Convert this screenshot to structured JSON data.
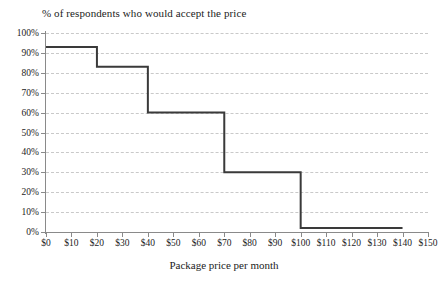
{
  "chart": {
    "title": "% of respondents who would accept the price",
    "xlabel": "Package price per month",
    "ylabel": ""
  },
  "chart_data": {
    "type": "line",
    "subtype": "step-post",
    "title": "% of respondents who would accept the price",
    "xlabel": "Package price per month",
    "ylabel": "",
    "xlim": [
      0,
      150
    ],
    "ylim": [
      0,
      100
    ],
    "grid": true,
    "legend": null,
    "x_tick_labels": [
      "$0",
      "$10",
      "$20",
      "$30",
      "$40",
      "$50",
      "$60",
      "$70",
      "$80",
      "$90",
      "$100",
      "$110",
      "$120",
      "$130",
      "$140",
      "$150"
    ],
    "x_tick_values": [
      0,
      10,
      20,
      30,
      40,
      50,
      60,
      70,
      80,
      90,
      100,
      110,
      120,
      130,
      140,
      150
    ],
    "y_tick_labels": [
      "0%",
      "10%",
      "20%",
      "30%",
      "40%",
      "50%",
      "60%",
      "70%",
      "80%",
      "90%",
      "100%"
    ],
    "y_tick_values": [
      0,
      10,
      20,
      30,
      40,
      50,
      60,
      70,
      80,
      90,
      100
    ],
    "series": [
      {
        "name": "% of respondents who would accept the price",
        "color": "#3a3a3a",
        "steps": [
          {
            "x_start": 0,
            "x_end": 20,
            "value": 93
          },
          {
            "x_start": 20,
            "x_end": 40,
            "value": 83
          },
          {
            "x_start": 40,
            "x_end": 70,
            "value": 60
          },
          {
            "x_start": 70,
            "x_end": 100,
            "value": 30
          },
          {
            "x_start": 100,
            "x_end": 140,
            "value": 2
          }
        ],
        "points": [
          {
            "x": 0,
            "y": 93
          },
          {
            "x": 20,
            "y": 93
          },
          {
            "x": 20,
            "y": 83
          },
          {
            "x": 40,
            "y": 83
          },
          {
            "x": 40,
            "y": 60
          },
          {
            "x": 70,
            "y": 60
          },
          {
            "x": 70,
            "y": 30
          },
          {
            "x": 100,
            "y": 30
          },
          {
            "x": 100,
            "y": 2
          },
          {
            "x": 140,
            "y": 2
          }
        ]
      }
    ]
  },
  "colors": {
    "line": "#3a3a3a",
    "grid": "#c9c9c9",
    "axis": "#8a8a8a",
    "text": "#1c1c1c",
    "background": "#ffffff"
  }
}
